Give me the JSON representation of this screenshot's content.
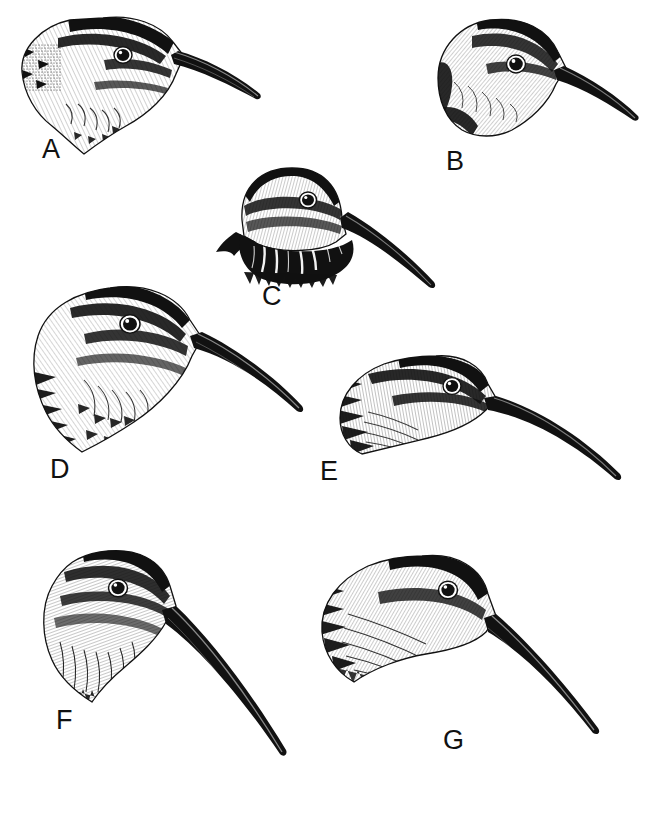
{
  "plate": {
    "type": "scientific-illustration-plate",
    "medium": "pen-and-ink line drawing",
    "subject": "snipe and woodcock head profiles",
    "background_color": "#ffffff",
    "ink_color": "#111111",
    "width_px": 657,
    "height_px": 817,
    "panel_count": 7,
    "caption_fragment": ""
  },
  "panels": [
    {
      "label": "A",
      "label_x": 42,
      "label_y": 136,
      "description": "Snipe head facing right, boldly striped crown, long straight bill angled slightly down, shaggy nape feathers",
      "head_x": 18,
      "head_y": 12,
      "bill_direction": "down-right",
      "bill_length": "long"
    },
    {
      "label": "B",
      "label_x": 446,
      "label_y": 148,
      "description": "Woodcock-type head facing right, rounded crown with dark cap, short shaggy nape, heavy straight bill",
      "head_x": 430,
      "head_y": 18,
      "bill_direction": "down-right",
      "bill_length": "medium"
    },
    {
      "label": "C",
      "label_x": 262,
      "label_y": 283,
      "description": "Head in three-quarter frontal view, dark barred crown, black throat fringe, long straight bill to lower right",
      "head_x": 212,
      "head_y": 163,
      "bill_direction": "down-right",
      "bill_length": "long"
    },
    {
      "label": "D",
      "label_x": 50,
      "label_y": 456,
      "description": "Large snipe head facing right, strong pale supercilium and dark eye-stripe, long heavy straight bill",
      "head_x": 36,
      "head_y": 280,
      "bill_direction": "down-right",
      "bill_length": "very-long"
    },
    {
      "label": "E",
      "label_x": 320,
      "label_y": 458,
      "description": "Head tilted downward facing right, heavily streaked nape, slightly decurved long bill",
      "head_x": 333,
      "head_y": 355,
      "bill_direction": "down-right-curved",
      "bill_length": "very-long"
    },
    {
      "label": "F",
      "label_x": 56,
      "label_y": 707,
      "description": "Head angled down-right, fine vertical hatching on throat, very long straight bill pointing steeply down",
      "head_x": 40,
      "head_y": 548,
      "bill_direction": "steep-down-right",
      "bill_length": "very-long"
    },
    {
      "label": "G",
      "label_x": 443,
      "label_y": 727,
      "description": "Head bowed forward facing right, broad nape with dense streaking, long bill angled down-right",
      "head_x": 310,
      "head_y": 552,
      "bill_direction": "down-right",
      "bill_length": "very-long"
    }
  ]
}
